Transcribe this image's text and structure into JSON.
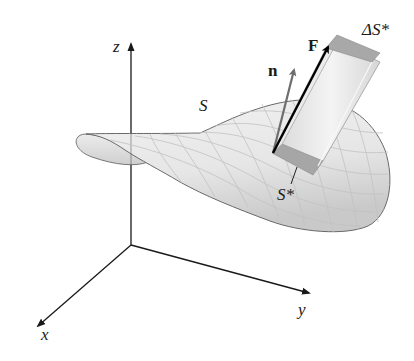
{
  "figure": {
    "labels": {
      "z_axis": "z",
      "x_axis": "x",
      "y_axis": "y",
      "surface": "S",
      "normal": "n",
      "field": "F",
      "prism": "ΔS*",
      "patch": "S*"
    },
    "colors": {
      "axis": "#1a1a1a",
      "surface_fill": "#e4e4e4",
      "surface_edge": "#6a6a6a",
      "grid": "#c4c4c4",
      "normal_arrow": "#6e6e6e",
      "field_arrow": "#000000",
      "prism_side": "#e8e8e8",
      "prism_top": "#a8a8a8",
      "patch": "#a6a6a6"
    }
  }
}
